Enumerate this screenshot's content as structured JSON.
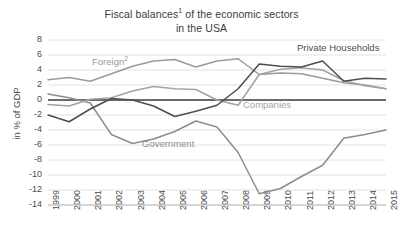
{
  "chart_data": {
    "type": "line",
    "title_line1": "Fiscal balances",
    "title_line1_sup": "1",
    "title_line1_rest": " of the economic sectors",
    "title_line2": "in the USA",
    "xlabel": "",
    "ylabel": "in % of GDP",
    "x": [
      1999,
      2000,
      2001,
      2002,
      2003,
      2004,
      2005,
      2006,
      2007,
      2008,
      2009,
      2010,
      2011,
      2012,
      2013,
      2014,
      2015
    ],
    "categories": [
      "1999",
      "2000",
      "2001",
      "2002",
      "2003",
      "2004",
      "2005",
      "2006",
      "2007",
      "2008",
      "2009",
      "2010",
      "2011",
      "2012",
      "2013",
      "2014",
      "2015"
    ],
    "ylim": [
      -14,
      8
    ],
    "ytick_labels": [
      "8",
      "6",
      "4",
      "2",
      "0",
      "-2",
      "-4",
      "-6",
      "-8",
      "-10",
      "-12",
      "-14"
    ],
    "yticks": [
      8,
      6,
      4,
      2,
      0,
      -2,
      -4,
      -6,
      -8,
      -10,
      -12,
      -14
    ],
    "grid": true,
    "grid_color": "#e2e2e2",
    "zero_line_color": "#3f3f3f",
    "legend": "inline-annotations",
    "legend_position": "inline",
    "series": [
      {
        "name": "Foreign²",
        "label": "Foreign",
        "label_sup": "2",
        "color": "#9a9a9a",
        "values": [
          2.7,
          3.0,
          2.5,
          3.5,
          4.5,
          5.2,
          5.4,
          4.4,
          5.2,
          5.5,
          3.4,
          3.6,
          3.5,
          2.9,
          2.3,
          2.0,
          1.5
        ]
      },
      {
        "name": "Government",
        "label": "Government",
        "color": "#8d8d8d",
        "values": [
          0.8,
          0.3,
          -0.4,
          -4.6,
          -5.8,
          -5.2,
          -4.2,
          -2.8,
          -3.6,
          -7.0,
          -12.5,
          -11.8,
          -10.2,
          -8.7,
          -5.1,
          -4.6,
          -4.0
        ]
      },
      {
        "name": "Companies",
        "label": "Companies",
        "color": "#a3a3a3",
        "values": [
          -0.6,
          -0.8,
          0.1,
          0.3,
          1.2,
          1.8,
          1.5,
          1.4,
          0.0,
          -0.7,
          3.4,
          4.1,
          4.3,
          4.0,
          2.6,
          1.9,
          1.5
        ]
      },
      {
        "name": "Private Households",
        "label": "Private Households",
        "color": "#4e4e4e",
        "values": [
          -2.0,
          -2.9,
          -1.2,
          0.2,
          0.0,
          -0.8,
          -2.2,
          -1.5,
          -0.7,
          1.5,
          4.8,
          4.5,
          4.4,
          5.2,
          2.5,
          2.9,
          2.8
        ]
      }
    ]
  }
}
